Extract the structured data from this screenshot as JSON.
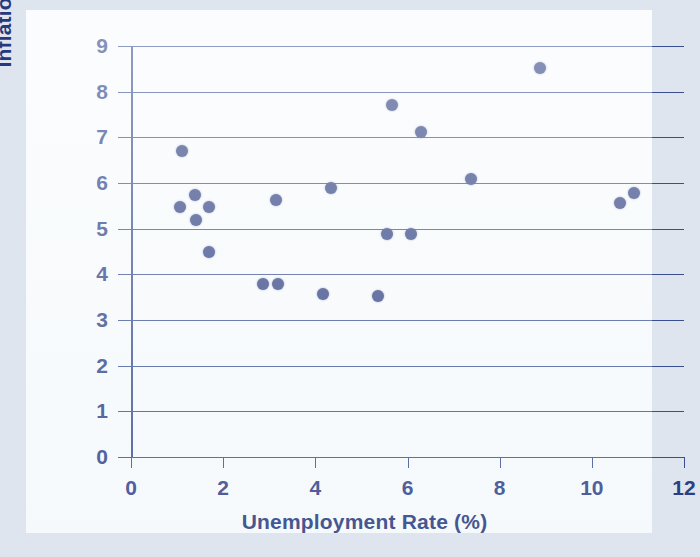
{
  "chart_data": {
    "type": "scatter",
    "title": "",
    "xlabel": "Unemployment Rate (%)",
    "ylabel": "Inflation Rate (%)",
    "xlim": [
      0,
      12
    ],
    "ylim": [
      0,
      9
    ],
    "xticks": [
      0,
      2,
      4,
      6,
      8,
      10,
      12
    ],
    "yticks": [
      0,
      1,
      2,
      3,
      4,
      5,
      6,
      7,
      8,
      9
    ],
    "xtick_labels": [
      "0",
      "2",
      "4",
      "6",
      "8",
      "10",
      "12"
    ],
    "ytick_labels": [
      "0",
      "1",
      "2",
      "3",
      "4",
      "5",
      "6",
      "7",
      "8",
      "9"
    ],
    "grid": "horizontal",
    "legend": "none",
    "marker_color": "#2e3f80",
    "axis_color": "#3a4f91",
    "points": [
      {
        "x": 1.1,
        "y": 6.7
      },
      {
        "x": 1.06,
        "y": 5.47
      },
      {
        "x": 1.39,
        "y": 5.73
      },
      {
        "x": 1.41,
        "y": 5.18
      },
      {
        "x": 1.69,
        "y": 5.47
      },
      {
        "x": 1.69,
        "y": 4.48
      },
      {
        "x": 2.86,
        "y": 3.78
      },
      {
        "x": 3.19,
        "y": 3.78
      },
      {
        "x": 3.15,
        "y": 5.63
      },
      {
        "x": 4.17,
        "y": 3.58
      },
      {
        "x": 4.35,
        "y": 5.88
      },
      {
        "x": 5.36,
        "y": 3.52
      },
      {
        "x": 5.56,
        "y": 4.88
      },
      {
        "x": 5.66,
        "y": 7.7
      },
      {
        "x": 6.08,
        "y": 4.88
      },
      {
        "x": 6.29,
        "y": 7.11
      },
      {
        "x": 7.38,
        "y": 6.08
      },
      {
        "x": 8.87,
        "y": 8.51
      },
      {
        "x": 10.62,
        "y": 5.57
      },
      {
        "x": 10.92,
        "y": 5.79
      }
    ]
  },
  "axes": {
    "y_title": "Inflation Rate (%)",
    "x_title": "Unemployment Rate (%)"
  }
}
